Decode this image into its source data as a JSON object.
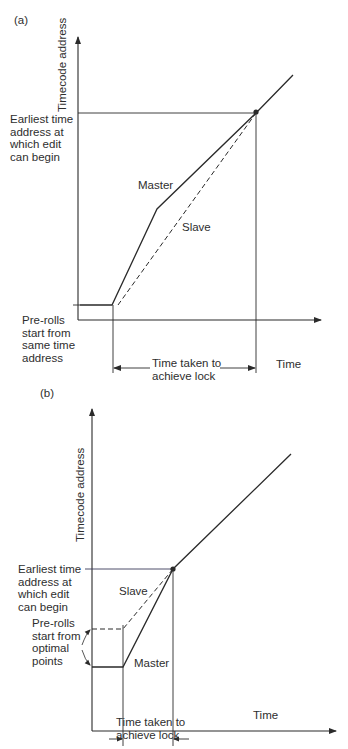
{
  "figure": {
    "panels": [
      {
        "tag": "(a)",
        "y_axis_label": "Timecode address",
        "x_axis_label": "Time",
        "earliest_label": "Earliest time\naddress at\nwhich edit\ncan begin",
        "preroll_label": "Pre-rolls\nstart from\nsame time\naddress",
        "master_label": "Master",
        "slave_label": "Slave",
        "lock_label_line1": "Time taken to",
        "lock_label_line2": "achieve lock"
      },
      {
        "tag": "(b)",
        "y_axis_label": "Timecode address",
        "x_axis_label": "Time",
        "earliest_label": "Earliest time\naddress at\nwhich edit\ncan begin",
        "preroll_label": "Pre-rolls\nstart from\noptimal\npoints",
        "master_label": "Master",
        "slave_label": "Slave",
        "lock_label_line1": "Time taken to",
        "lock_label_line2": "achieve lock"
      }
    ],
    "colors": {
      "line": "#2a2a2a",
      "text": "#2e2e2e",
      "background": "#ffffff"
    }
  }
}
